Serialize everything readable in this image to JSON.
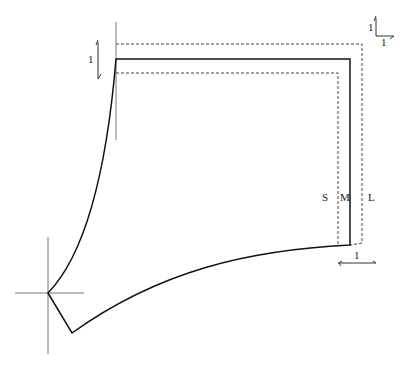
{
  "diagram": {
    "type": "sewing-pattern-grading",
    "size_labels": [
      {
        "id": "S",
        "label": "S"
      },
      {
        "id": "M",
        "label": "M"
      },
      {
        "id": "L",
        "label": "L"
      }
    ],
    "grade_arrows": {
      "vertical_left": {
        "label": "1"
      },
      "corner_top_right": {
        "vertical_label": "1",
        "horizontal_label": "1"
      },
      "horizontal_bottom_right": {
        "label": "1"
      }
    },
    "colors": {
      "solid_line": "#111111",
      "dashed_line": "#444444",
      "guide_line": "#777777"
    }
  }
}
